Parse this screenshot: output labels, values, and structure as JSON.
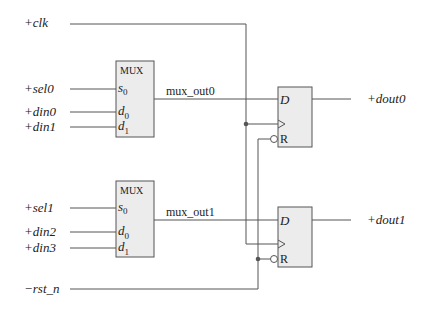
{
  "inputs": {
    "clk": "+clk",
    "sel0": "+sel0",
    "din0": "+din0",
    "din1": "+din1",
    "sel1": "+sel1",
    "din2": "+din2",
    "din3": "+din3",
    "rst_n": "−rst_n"
  },
  "outputs": {
    "dout0": "+dout0",
    "dout1": "+dout1"
  },
  "muxes": [
    {
      "title": "MUX",
      "sel_pin": "s",
      "sel_sub": "0",
      "d0_pin": "d",
      "d0_sub": "0",
      "d1_pin": "d",
      "d1_sub": "1",
      "output_net": "mux_out0"
    },
    {
      "title": "MUX",
      "sel_pin": "s",
      "sel_sub": "0",
      "d0_pin": "d",
      "d0_sub": "0",
      "d1_pin": "d",
      "d1_sub": "1",
      "output_net": "mux_out1"
    }
  ],
  "flipflops": [
    {
      "d_pin": "D",
      "reset_pin": "R"
    },
    {
      "d_pin": "D",
      "reset_pin": "R"
    }
  ],
  "colors": {
    "wire": "#555555",
    "block_fill": "#ececec",
    "background": "#ffffff"
  }
}
